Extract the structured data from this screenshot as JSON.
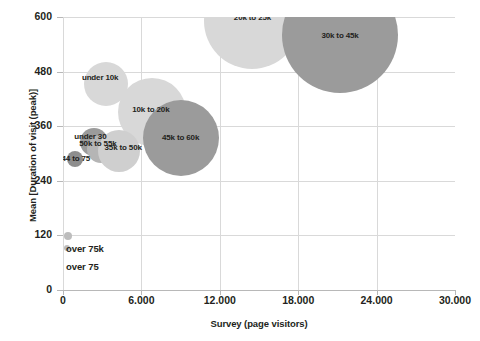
{
  "chart_data": {
    "type": "scatter",
    "title": "",
    "xlabel": "Survey (page visitors)",
    "ylabel": "Mean [Duration of visit (peak)]",
    "xlim": [
      0,
      30000
    ],
    "ylim": [
      0,
      600
    ],
    "grid": true,
    "legend": "none",
    "xticks": [
      "0",
      "6.000",
      "12.000",
      "18.000",
      "24.000",
      "30.000"
    ],
    "xtick_values": [
      0,
      6000,
      12000,
      18000,
      24000,
      30000
    ],
    "yticks": [
      "0",
      "120",
      "240",
      "360",
      "480",
      "600"
    ],
    "ytick_values": [
      0,
      120,
      240,
      360,
      480,
      600
    ],
    "points": [
      {
        "label": "20k to 25k",
        "x": 14500,
        "y": 592,
        "size": 48,
        "color": "#d8d8d8",
        "label_dx": 0,
        "label_dy": -3
      },
      {
        "label": "30k to 45k",
        "x": 21200,
        "y": 561,
        "size": 58,
        "color": "#9b9b9b",
        "label_dx": 0,
        "label_dy": 1
      },
      {
        "label": "under 10k",
        "x": 3300,
        "y": 453,
        "size": 22,
        "color": "#d8d8d8",
        "label_dx": -6,
        "label_dy": -6
      },
      {
        "label": "10k to 20k",
        "x": 6800,
        "y": 392,
        "size": 34,
        "color": "#d8d8d8",
        "label_dx": -1,
        "label_dy": -2
      },
      {
        "label": "45k to 60k",
        "x": 9000,
        "y": 334,
        "size": 38,
        "color": "#9b9b9b",
        "label_dx": 0,
        "label_dy": 0
      },
      {
        "label": "under 30",
        "x": 2400,
        "y": 326,
        "size": 14,
        "color": "#9b9b9b",
        "label_dx": -4,
        "label_dy": -5
      },
      {
        "label": "50k to 55k",
        "x": 2900,
        "y": 310,
        "size": 14,
        "color": "#b5b5b5",
        "label_dx": -3,
        "label_dy": -5
      },
      {
        "label": "35k to 50k",
        "x": 4300,
        "y": 305,
        "size": 21,
        "color": "#cfcfcf",
        "label_dx": 4,
        "label_dy": -3
      },
      {
        "label": "44 to 75",
        "x": 900,
        "y": 288,
        "size": 8,
        "color": "#8e8e8e",
        "label_dx": 1,
        "label_dy": 0
      },
      {
        "label": "over 75k",
        "x": 350,
        "y": 118,
        "size": 4,
        "color": "#bdbdbd",
        "label_dx": 0,
        "label_dy": 0
      },
      {
        "label": "over 75",
        "x": 330,
        "y": 92,
        "size": 3,
        "color": "#bdbdbd",
        "label_dx": 0,
        "label_dy": 0
      }
    ],
    "outside_labels": [
      {
        "text": "over 75k",
        "x_px": 66,
        "y_px": 243
      },
      {
        "text": "over 75",
        "x_px": 66,
        "y_px": 261
      }
    ]
  },
  "colors": {
    "gridline": "#d9d9d9",
    "axis": "#b8b8b8",
    "text": "#231f20",
    "bubble_light": "#d8d8d8",
    "bubble_dark": "#9b9b9b",
    "background": "#ffffff"
  }
}
